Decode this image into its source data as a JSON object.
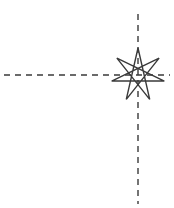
{
  "figure": {
    "width": 174,
    "height": 208,
    "background_color": "#ffffff",
    "stroke_color": "#3a3a3a",
    "title": "",
    "caption": ""
  },
  "chart_data": {
    "type": "scatter",
    "title": "",
    "subtitle": "",
    "xlabel": "",
    "ylabel": "",
    "grid": false,
    "legend": null,
    "axes": {
      "horizontal_axis": {
        "name": "horizontal-dashed-axis",
        "orientation": "horizontal",
        "y": 75,
        "x_start": 4,
        "x_end": 170,
        "style": "dashed",
        "color": "#3a3a3a",
        "width": 1.4,
        "dash_pattern": "6 5",
        "tick_labels": []
      },
      "vertical_axis": {
        "name": "vertical-dashed-axis",
        "orientation": "vertical",
        "x": 138,
        "y_start": 14,
        "y_end": 204,
        "style": "dashed",
        "color": "#3a3a3a",
        "width": 1.4,
        "dash_pattern": "6 5",
        "tick_labels": []
      }
    },
    "origin": {
      "x": 138,
      "y": 75
    },
    "markers": [
      {
        "name": "seven-pointed-star",
        "shape": "star-polygon",
        "points": 7,
        "step": 3,
        "cx": 138,
        "cy": 75,
        "outer_radius": 27,
        "rotation_deg": -90,
        "fill": "none",
        "stroke": "#3a3a3a",
        "stroke_width": 1.4
      }
    ],
    "annotations": []
  }
}
